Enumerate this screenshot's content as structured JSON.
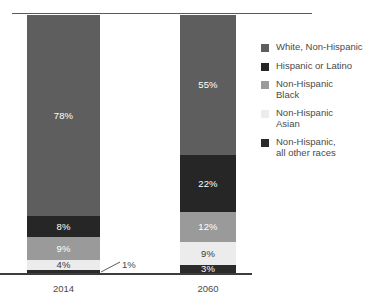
{
  "chart_data": {
    "type": "bar",
    "subtype": "100% stacked bar",
    "title": "",
    "subtitle": "",
    "xlabel": "",
    "ylabel": "",
    "ylim": [
      0,
      100
    ],
    "grid": false,
    "legend_position": "right",
    "categories": [
      "2014",
      "2060"
    ],
    "series": [
      {
        "name": "White, Non-Hispanic",
        "values": [
          78,
          55
        ],
        "color": "#5e5e5e"
      },
      {
        "name": "Hispanic or Latino",
        "values": [
          8,
          22
        ],
        "color": "#262626"
      },
      {
        "name": "Non-Hispanic Black",
        "values": [
          9,
          12
        ],
        "color": "#9a9a9a"
      },
      {
        "name": "Non-Hispanic Asian",
        "values": [
          4,
          9
        ],
        "color": "#ececec"
      },
      {
        "name": "Non-Hispanic, all other races",
        "values": [
          1,
          3
        ],
        "color": "#2b2b2b"
      }
    ],
    "annotations": [
      {
        "text": "1%",
        "series": "Non-Hispanic, all other races",
        "category": "2014",
        "style": "leader-line callout"
      }
    ]
  },
  "bars": [
    {
      "year_label": "2014",
      "segments": [
        {
          "label": "78%",
          "value": 78,
          "color": "#5e5e5e",
          "label_style": "light",
          "label_inside": true
        },
        {
          "label": "8%",
          "value": 8,
          "color": "#262626",
          "label_style": "light",
          "label_inside": true
        },
        {
          "label": "9%",
          "value": 9,
          "color": "#9a9a9a",
          "label_style": "light",
          "label_inside": true
        },
        {
          "label": "4%",
          "value": 4,
          "color": "#ececec",
          "label_style": "dark",
          "label_inside": true
        },
        {
          "label": "1%",
          "value": 1,
          "color": "#2b2b2b",
          "label_style": "dark",
          "label_inside": false
        }
      ]
    },
    {
      "year_label": "2060",
      "segments": [
        {
          "label": "55%",
          "value": 55,
          "color": "#5e5e5e",
          "label_style": "light",
          "label_inside": true
        },
        {
          "label": "22%",
          "value": 22,
          "color": "#262626",
          "label_style": "light",
          "label_inside": true
        },
        {
          "label": "12%",
          "value": 12,
          "color": "#9a9a9a",
          "label_style": "light",
          "label_inside": true
        },
        {
          "label": "9%",
          "value": 9,
          "color": "#ececec",
          "label_style": "dark",
          "label_inside": true
        },
        {
          "label": "3%",
          "value": 3,
          "color": "#2b2b2b",
          "label_style": "light",
          "label_inside": true
        }
      ]
    }
  ],
  "callout": {
    "text": "1%"
  },
  "legend": {
    "items": [
      {
        "label": "White, Non-Hispanic",
        "color": "#5e5e5e"
      },
      {
        "label": "Hispanic or Latino",
        "color": "#262626"
      },
      {
        "label": "Non-Hispanic\nBlack",
        "color": "#9a9a9a"
      },
      {
        "label": "Non-Hispanic\nAsian",
        "color": "#ececec"
      },
      {
        "label": "Non-Hispanic,\nall other races",
        "color": "#2b2b2b"
      }
    ]
  },
  "colors": {
    "top_rule": "#5a5a5a",
    "baseline": "#3d3d3d",
    "text": "#4a4a4a",
    "background": "#ffffff"
  }
}
